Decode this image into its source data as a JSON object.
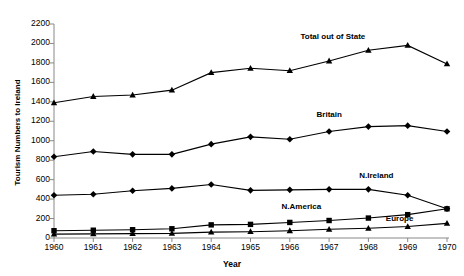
{
  "chart_data": {
    "type": "line",
    "title": "",
    "xlabel": "Year",
    "ylabel": "Tourism Numbers to Ireland",
    "x": [
      1960,
      1961,
      1962,
      1963,
      1964,
      1965,
      1966,
      1967,
      1968,
      1969,
      1970
    ],
    "categories": [
      "1960",
      "1961",
      "1962",
      "1963",
      "1964",
      "1965",
      "1966",
      "1967",
      "1968",
      "1969",
      "1970"
    ],
    "xlim": [
      1960,
      1970
    ],
    "ylim": [
      0,
      2200
    ],
    "ytick_labels": [
      "0",
      "200",
      "400",
      "600",
      "800",
      "1000",
      "1200",
      "1400",
      "1600",
      "1800",
      "2000",
      "2200"
    ],
    "ytick_values": [
      0,
      200,
      400,
      600,
      800,
      1000,
      1200,
      1400,
      1600,
      1800,
      2000,
      2200
    ],
    "grid": false,
    "legend_position": "inline-annotations",
    "series": [
      {
        "name": "Total out of State",
        "marker": "triangle",
        "label_x": 1967.1,
        "label_y": 2070,
        "values": [
          1390,
          1455,
          1470,
          1520,
          1700,
          1745,
          1720,
          1820,
          1930,
          1980,
          1790
        ]
      },
      {
        "name": "Britain",
        "marker": "diamond",
        "label_x": 1967.0,
        "label_y": 1260,
        "values": [
          835,
          890,
          860,
          860,
          965,
          1040,
          1015,
          1095,
          1145,
          1155,
          1095
        ]
      },
      {
        "name": "N.Ireland",
        "marker": "diamond",
        "label_x": 1968.2,
        "label_y": 640,
        "values": [
          440,
          450,
          485,
          510,
          550,
          490,
          495,
          500,
          500,
          440,
          300
        ]
      },
      {
        "name": "N.America",
        "marker": "square",
        "label_x": 1966.3,
        "label_y": 320,
        "values": [
          75,
          80,
          85,
          95,
          135,
          140,
          160,
          180,
          205,
          240,
          300
        ]
      },
      {
        "name": "Europe",
        "marker": "triangle",
        "label_x": 1968.8,
        "label_y": 200,
        "values": [
          40,
          42,
          45,
          48,
          60,
          65,
          75,
          90,
          100,
          118,
          150
        ]
      }
    ]
  }
}
